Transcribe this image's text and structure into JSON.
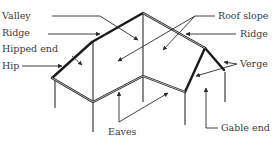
{
  "diagram": {
    "labels": {
      "valley": "Valley",
      "ridge_left": "Ridge",
      "hipped_end": "Hipped end",
      "hip": "Hip",
      "roof_slope": "Roof slope",
      "ridge_right": "Ridge",
      "verge": "Verge",
      "eaves": "Eaves",
      "gable_end": "Gable end"
    }
  }
}
